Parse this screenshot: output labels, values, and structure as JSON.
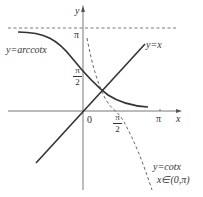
{
  "diagram": {
    "axes": {
      "x_label": "x",
      "y_label": "y",
      "origin_label": "0"
    },
    "y_ticks": [
      {
        "label": "π"
      },
      {
        "label_num": "π",
        "label_den": "2"
      }
    ],
    "x_ticks": [
      {
        "label_num": "π",
        "label_den": "2"
      },
      {
        "label": "π"
      }
    ],
    "curves": [
      {
        "name": "y=arccotx",
        "label": "y=arccotx",
        "style": "solid"
      },
      {
        "name": "y=x",
        "label": "y=x",
        "style": "solid"
      },
      {
        "name": "y=cotx",
        "label": "y=cotx",
        "domain_label": "x∈(0,π)",
        "style": "dashed"
      }
    ],
    "asymptote": {
      "label": "y=π",
      "style": "dashed"
    },
    "colors": {
      "line": "#333333",
      "background": "#ffffff"
    }
  }
}
